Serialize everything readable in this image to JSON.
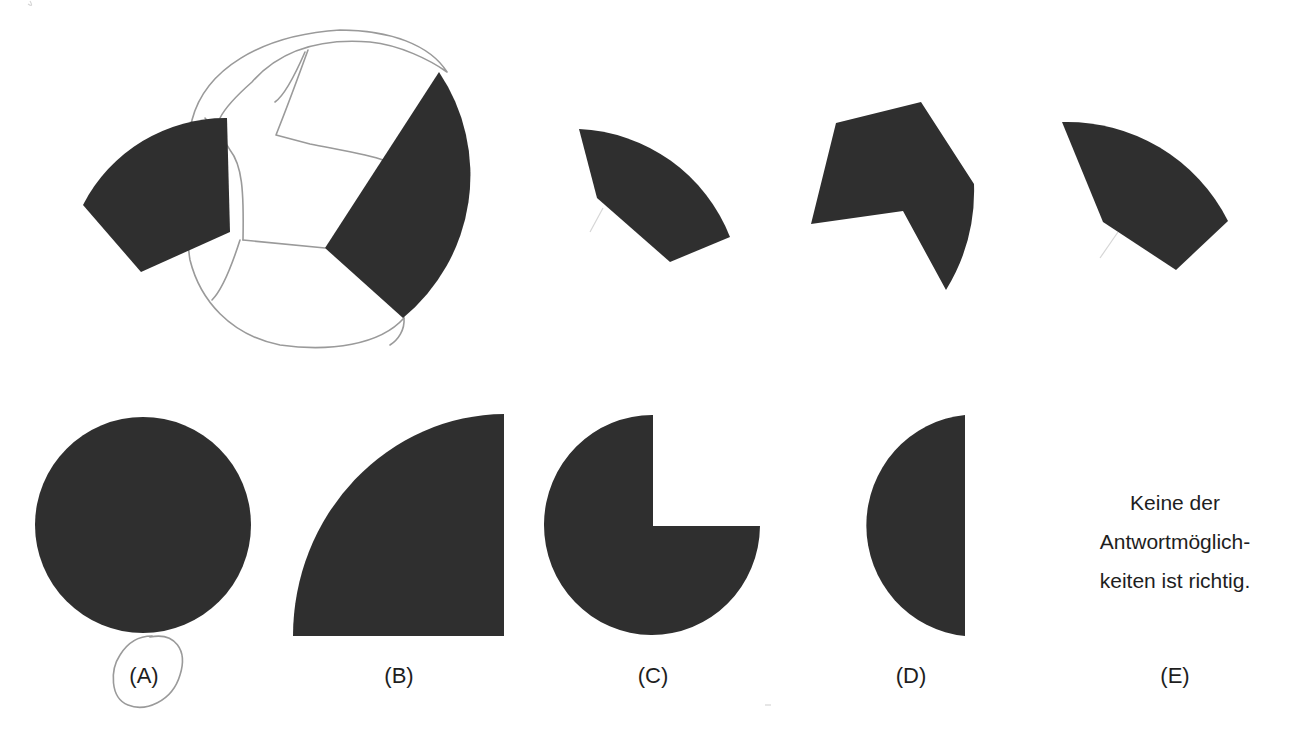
{
  "puzzle": {
    "type": "shape-assembly",
    "pieces_count": 4,
    "fill_color": "#2f2f2f",
    "sketch_color": "#9a9a9a",
    "background": "#ffffff"
  },
  "answers": [
    {
      "label": "(A)",
      "shape": "full-circle",
      "circled": true
    },
    {
      "label": "(B)",
      "shape": "quarter-circle"
    },
    {
      "label": "(C)",
      "shape": "three-quarter-circle"
    },
    {
      "label": "(D)",
      "shape": "half-circle"
    },
    {
      "label": "(E)",
      "shape": "text",
      "text_lines": [
        "Keine der",
        "Antwortmöglich-",
        "keiten ist richtig."
      ]
    }
  ]
}
